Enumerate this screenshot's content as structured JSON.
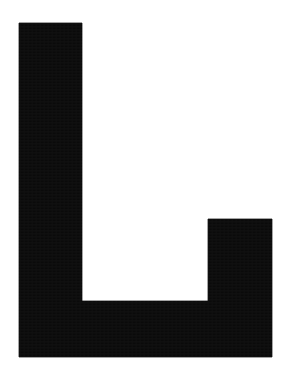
{
  "image": {
    "kind": "letterform-specimen",
    "subject": "capital-letter-L",
    "character": "L",
    "description": "Large solid black capital letter L on a plain white background",
    "width": 282,
    "height": 375,
    "background_color": "#ffffff",
    "ink_color": "#0a0a0a",
    "orientation": "upright",
    "fill_style": "solid"
  },
  "glyph": {
    "name": "L",
    "stroke_count": 2,
    "outline_points": "19,23 82,23 82,301 208,301 208,219 272,219 272,357 19,357",
    "parts": [
      {
        "name": "vertical-stem",
        "x": 19,
        "y": 23,
        "width": 63,
        "height": 334
      },
      {
        "name": "horizontal-base-bar",
        "x": 19,
        "y": 301,
        "width": 253,
        "height": 56
      },
      {
        "name": "right-terminal-riser",
        "x": 208,
        "y": 219,
        "width": 64,
        "height": 138
      }
    ],
    "bounding_box": {
      "left": 19,
      "top": 23,
      "right": 272,
      "bottom": 357,
      "width": 253,
      "height": 334
    },
    "inner_notch": {
      "name": "counter-space",
      "left": 82,
      "top": 219,
      "right": 208,
      "bottom": 301
    }
  },
  "metrics": {
    "stem_width": 63,
    "base_bar_height": 56,
    "riser_width": 64,
    "riser_height": 138,
    "cap_height": 334,
    "total_advance_width": 253
  }
}
